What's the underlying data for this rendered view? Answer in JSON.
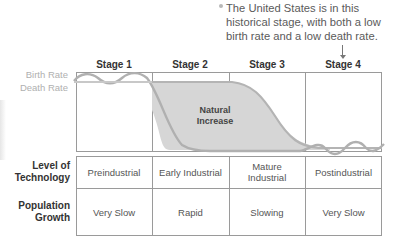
{
  "note": {
    "text": "The United States is in this historical stage, with both a low birth rate and a low death rate."
  },
  "stages": [
    {
      "label": "Stage 1"
    },
    {
      "label": "Stage 2"
    },
    {
      "label": "Stage 3"
    },
    {
      "label": "Stage 4"
    }
  ],
  "chart": {
    "birth_rate_label": "Birth Rate",
    "death_rate_label": "Death Rate",
    "area_label_line1": "Natural",
    "area_label_line2": "Increase",
    "colors": {
      "birth_line": "#c8c8c8",
      "death_line": "#a8a8a8",
      "area_fill": "#d6d6d6",
      "grid": "#9a9a9a"
    }
  },
  "table": {
    "rows": [
      {
        "label_line1": "Level of",
        "label_line2": "Technology",
        "cells": [
          {
            "line1": "Preindustrial",
            "line2": ""
          },
          {
            "line1": "Early Industrial",
            "line2": ""
          },
          {
            "line1": "Mature",
            "line2": "Industrial"
          },
          {
            "line1": "Postindustrial",
            "line2": ""
          }
        ]
      },
      {
        "label_line1": "Population",
        "label_line2": "Growth",
        "cells": [
          {
            "line1": "Very Slow"
          },
          {
            "line1": "Rapid"
          },
          {
            "line1": "Slowing"
          },
          {
            "line1": "Very Slow"
          }
        ]
      }
    ]
  }
}
